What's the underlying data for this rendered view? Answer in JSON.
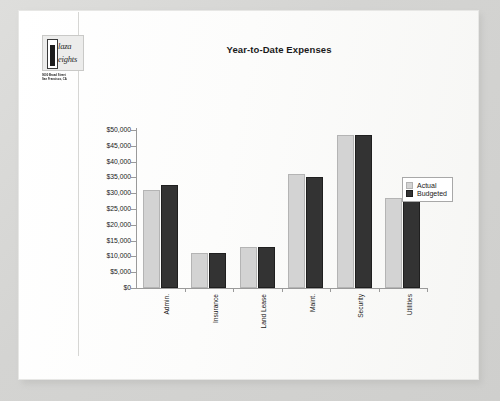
{
  "document": {
    "logo": {
      "name_line_1": "laza",
      "name_line_2": "eights",
      "dropcap_1": "P",
      "dropcap_2": "H",
      "address_line_1": "9000 Broad Street",
      "address_line_2": "San Francisco, CA"
    }
  },
  "chart_data": {
    "type": "bar",
    "title": "Year-to-Date Expenses",
    "xlabel": "",
    "ylabel": "",
    "ylim": [
      0,
      50000
    ],
    "grid": false,
    "legend_position": "right",
    "categories": [
      "Admin.",
      "Insurance",
      "Land Lease",
      "Maint.",
      "Security",
      "Utilities"
    ],
    "ytick_labels": [
      "$50,000",
      "$45,000",
      "$40,000",
      "$35,000",
      "$30,000",
      "$25,000",
      "$20,000",
      "$15,000",
      "$10,000",
      "$5,000",
      "$0"
    ],
    "ytick_values": [
      50000,
      45000,
      40000,
      35000,
      30000,
      25000,
      20000,
      15000,
      10000,
      5000,
      0
    ],
    "series": [
      {
        "name": "Actual",
        "color": "#d3d3d3",
        "values": [
          31000,
          11000,
          13000,
          36000,
          48500,
          28500
        ]
      },
      {
        "name": "Budgeted",
        "color": "#333333",
        "values": [
          32500,
          11000,
          13000,
          35000,
          48500,
          29000
        ]
      }
    ]
  }
}
